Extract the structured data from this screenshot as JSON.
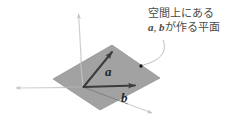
{
  "figure": {
    "annotation": {
      "line1": "空間上にある",
      "vector_a": "a",
      "separator": ", ",
      "vector_b": "b",
      "line2_suffix": "が作る平面"
    },
    "labels": {
      "vector_a": "a",
      "vector_b": "b"
    },
    "colors": {
      "background": "#ffffff",
      "plane_fill": "#9a9a9a",
      "plane_stroke": "#8a8a8a",
      "axis": "#d0d0d0",
      "vector": "#3c3c3c",
      "text": "#4a4a4a",
      "leader": "#b0b0b0",
      "dot": "#1a1a1a"
    },
    "geometry": {
      "origin": [
        83,
        87
      ],
      "axis_vertical_tip": [
        78,
        10
      ],
      "axis_left_tip": [
        12,
        88
      ],
      "axis_front_tip": [
        156,
        116
      ],
      "plane_corners": [
        [
          53,
          79
        ],
        [
          112,
          45
        ],
        [
          160,
          78
        ],
        [
          100,
          110
        ]
      ],
      "vector_a_tip": [
        116,
        47
      ],
      "vector_b_tip": [
        141,
        85
      ],
      "label_a_pos": [
        105,
        74
      ],
      "label_b_pos": [
        122,
        101
      ],
      "dot_pos": [
        141,
        66
      ],
      "leader_start": [
        162,
        40
      ],
      "leader_end": [
        142,
        64
      ]
    }
  }
}
